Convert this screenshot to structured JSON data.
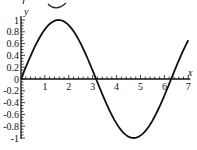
{
  "chart_data": {
    "type": "line",
    "title": "",
    "xlabel": "x",
    "ylabel": "y",
    "function": "y = sin(x)",
    "xlim": [
      0,
      7
    ],
    "ylim": [
      -1,
      1
    ],
    "x_ticks": [
      "1",
      "2",
      "3",
      "4",
      "5",
      "6",
      "7"
    ],
    "y_ticks": [
      "1",
      "0.8",
      "0.6",
      "0.4",
      "0.2",
      "0",
      "-0.2",
      "-0.4",
      "-0.6",
      "-0.8",
      "-1"
    ],
    "grid": false,
    "legend": null,
    "series": [
      {
        "name": "sin(x)",
        "x": [
          0,
          0.5,
          1,
          1.5,
          1.571,
          2,
          2.5,
          3,
          3.142,
          3.5,
          4,
          4.5,
          4.712,
          5,
          5.5,
          6,
          6.283,
          6.5,
          7
        ],
        "y": [
          0,
          0.479,
          0.841,
          0.997,
          1,
          0.909,
          0.598,
          0.141,
          0,
          -0.351,
          -0.757,
          -0.978,
          -1,
          -0.959,
          -0.706,
          -0.279,
          0,
          0.215,
          0.657
        ]
      }
    ]
  },
  "style": {
    "line_color": "#111111",
    "axis_color": "#111111",
    "background": "#ffffff"
  }
}
